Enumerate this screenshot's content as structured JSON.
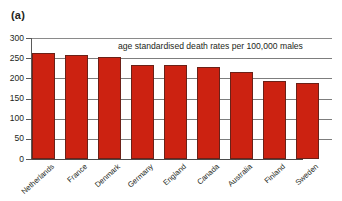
{
  "figure": {
    "panel_label": "(a)",
    "note": "age standardised death rates per 100,000 males"
  },
  "chart_data": {
    "type": "bar",
    "title": "",
    "annotation": "age standardised death rates per 100,000 males",
    "xlabel": "",
    "ylabel": "",
    "ylim": [
      0,
      300
    ],
    "yticks": [
      0,
      50,
      100,
      150,
      200,
      250,
      300
    ],
    "ytick_labels": [
      "0",
      "50",
      "100",
      "150",
      "200",
      "250",
      "300"
    ],
    "grid": true,
    "legend": "none",
    "bar_color": "#cc2211",
    "bar_edge_color": "#6b2118",
    "categories": [
      "Netherlands",
      "France",
      "Denmark",
      "Germany",
      "England",
      "Canada",
      "Australia",
      "Finland",
      "Sweden"
    ],
    "values": [
      263,
      259,
      252,
      234,
      233,
      227,
      215,
      194,
      188
    ]
  }
}
